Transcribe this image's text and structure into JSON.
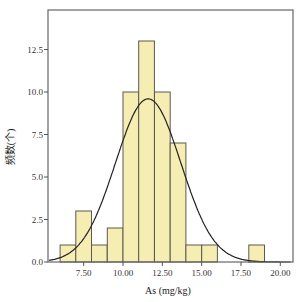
{
  "chart_data": {
    "type": "bar",
    "subtype": "histogram_with_normal_curve",
    "title": "",
    "xlabel": "As (mg/kg)",
    "ylabel": "频数(个)",
    "bin_width": 1,
    "bins": [
      {
        "start": 6,
        "end": 7,
        "count": 1
      },
      {
        "start": 7,
        "end": 8,
        "count": 3
      },
      {
        "start": 8,
        "end": 9,
        "count": 1
      },
      {
        "start": 9,
        "end": 10,
        "count": 2
      },
      {
        "start": 10,
        "end": 11,
        "count": 10
      },
      {
        "start": 11,
        "end": 12,
        "count": 13
      },
      {
        "start": 12,
        "end": 13,
        "count": 10
      },
      {
        "start": 13,
        "end": 14,
        "count": 7
      },
      {
        "start": 14,
        "end": 15,
        "count": 1
      },
      {
        "start": 15,
        "end": 16,
        "count": 1
      },
      {
        "start": 18,
        "end": 19,
        "count": 1
      }
    ],
    "categories": [
      "6-7",
      "7-8",
      "8-9",
      "9-10",
      "10-11",
      "11-12",
      "12-13",
      "13-14",
      "14-15",
      "15-16",
      "18-19"
    ],
    "values": [
      1,
      3,
      1,
      2,
      10,
      13,
      10,
      7,
      1,
      1,
      1
    ],
    "normal_curve": {
      "mean": 11.6,
      "std": 2.08,
      "n": 50,
      "peak": 9.6
    },
    "x_ticks": [
      "7.50",
      "10.00",
      "12.50",
      "15.00",
      "17.50",
      "20.00"
    ],
    "x_tick_values": [
      7.5,
      10,
      12.5,
      15,
      17.5,
      20
    ],
    "y_ticks": [
      "0.0",
      "2.5",
      "5.0",
      "7.5",
      "10.0",
      "12.5"
    ],
    "y_tick_values": [
      0,
      2.5,
      5,
      7.5,
      10,
      12.5
    ],
    "xlim": [
      5.3,
      20.7
    ],
    "ylim": [
      0,
      14.9
    ],
    "grid": false,
    "legend": null,
    "colors": {
      "bar_fill": "#F6EDB3",
      "bar_edge": "#5a5a50",
      "curve": "#222222",
      "frame": "#666666"
    }
  }
}
